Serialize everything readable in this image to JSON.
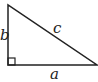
{
  "diagram": {
    "type": "right-triangle",
    "labels": {
      "leg_vertical": "b",
      "hypotenuse": "c",
      "leg_horizontal": "a"
    },
    "right_angle_marker": true,
    "stroke_color": "#222222"
  }
}
